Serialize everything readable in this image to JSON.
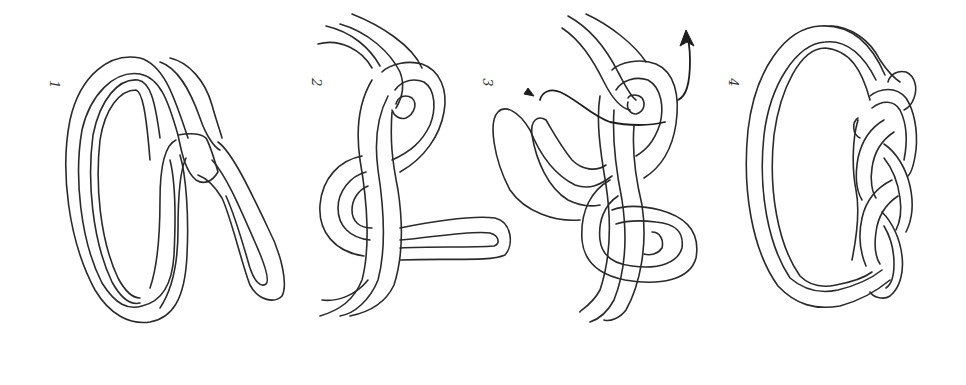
{
  "figure": {
    "ink_color": "#2a2a2a",
    "background_color": "#ffffff",
    "steps": [
      {
        "label": "1",
        "name": "Form loop and bight"
      },
      {
        "label": "2",
        "name": "Cross over, form second loop"
      },
      {
        "label": "3",
        "name": "Weave working end through, pull (arrows)"
      },
      {
        "label": "4",
        "name": "Finished braided band"
      }
    ]
  }
}
